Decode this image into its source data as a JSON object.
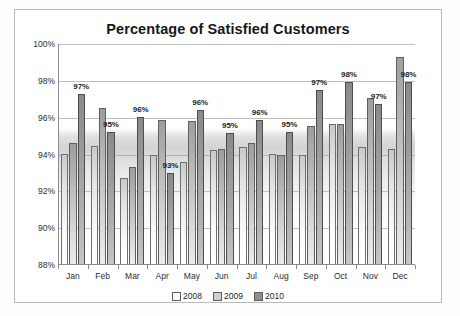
{
  "chart_data": {
    "type": "bar",
    "title": "Percentage of Satisfied Customers",
    "xlabel": "",
    "ylabel": "",
    "ylim": [
      88,
      100
    ],
    "ytick_values": [
      88,
      90,
      92,
      94,
      96,
      98,
      100
    ],
    "ytick_labels": [
      "88%",
      "90%",
      "92%",
      "94%",
      "96%",
      "98%",
      "100%"
    ],
    "grid": true,
    "legend_position": "bottom-center",
    "categories": [
      "Jan",
      "Feb",
      "Mar",
      "Apr",
      "May",
      "Jun",
      "Jul",
      "Aug",
      "Sep",
      "Oct",
      "Nov",
      "Dec"
    ],
    "series": [
      {
        "name": "2008",
        "values": [
          94.05,
          94.45,
          92.75,
          94.0,
          93.6,
          94.25,
          94.4,
          94.05,
          93.95,
          95.65,
          94.4,
          94.3
        ],
        "labels": [
          "",
          "",
          "",
          "",
          "",
          "",
          "",
          "",
          "",
          "",
          "",
          ""
        ]
      },
      {
        "name": "2009",
        "values": [
          94.6,
          96.55,
          93.3,
          95.85,
          95.8,
          94.3,
          94.6,
          93.95,
          95.55,
          95.65,
          97.05,
          99.3
        ],
        "labels": [
          "",
          "",
          "",
          "",
          "",
          "",
          "",
          "",
          "",
          "",
          "",
          ""
        ]
      },
      {
        "name": "2010",
        "values": [
          97.3,
          95.2,
          96.05,
          93.0,
          96.4,
          95.15,
          95.85,
          95.2,
          97.5,
          97.95,
          96.75,
          97.95
        ],
        "labels": [
          "97%",
          "95%",
          "96%",
          "93%",
          "96%",
          "95%",
          "96%",
          "95%",
          "97%",
          "98%",
          "97%",
          "98%"
        ]
      }
    ],
    "legend": [
      {
        "label": "2008",
        "swatch": "#ffffff"
      },
      {
        "label": "2009",
        "swatch": "#d0d0d0"
      },
      {
        "label": "2010",
        "swatch": "#8f8f8f"
      }
    ]
  }
}
